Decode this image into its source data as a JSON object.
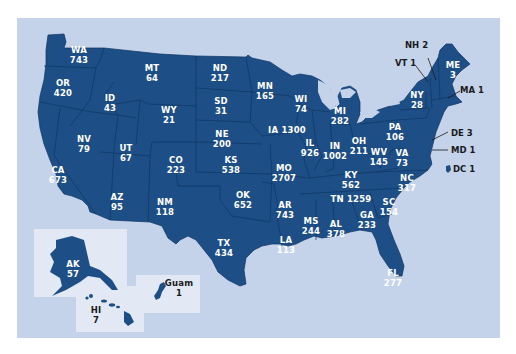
{
  "map": {
    "colors": {
      "background": "#ffffff",
      "panel": "#c4d2ea",
      "state_fill": "#1d4f86",
      "state_border": "#0f3563",
      "inset_box": "#e2e9f5",
      "label_text": "#ffffff",
      "external_label_text": "#1a1a1a"
    },
    "states": [
      {
        "abbr": "WA",
        "value": "743"
      },
      {
        "abbr": "OR",
        "value": "420"
      },
      {
        "abbr": "CA",
        "value": "673"
      },
      {
        "abbr": "ID",
        "value": "43"
      },
      {
        "abbr": "NV",
        "value": "79"
      },
      {
        "abbr": "MT",
        "value": "64"
      },
      {
        "abbr": "WY",
        "value": "21"
      },
      {
        "abbr": "UT",
        "value": "67"
      },
      {
        "abbr": "AZ",
        "value": "95"
      },
      {
        "abbr": "CO",
        "value": "223"
      },
      {
        "abbr": "NM",
        "value": "118"
      },
      {
        "abbr": "ND",
        "value": "217"
      },
      {
        "abbr": "SD",
        "value": "31"
      },
      {
        "abbr": "NE",
        "value": "200"
      },
      {
        "abbr": "KS",
        "value": "538"
      },
      {
        "abbr": "OK",
        "value": "652"
      },
      {
        "abbr": "TX",
        "value": "434"
      },
      {
        "abbr": "MN",
        "value": "165"
      },
      {
        "abbr": "IA",
        "value": "1300"
      },
      {
        "abbr": "MO",
        "value": "2707"
      },
      {
        "abbr": "AR",
        "value": "743"
      },
      {
        "abbr": "LA",
        "value": "113"
      },
      {
        "abbr": "WI",
        "value": "74"
      },
      {
        "abbr": "IL",
        "value": "926"
      },
      {
        "abbr": "MI",
        "value": "282"
      },
      {
        "abbr": "IN",
        "value": "1002"
      },
      {
        "abbr": "OH",
        "value": "211"
      },
      {
        "abbr": "KY",
        "value": "562"
      },
      {
        "abbr": "TN",
        "value": "1259"
      },
      {
        "abbr": "MS",
        "value": "244"
      },
      {
        "abbr": "AL",
        "value": "378"
      },
      {
        "abbr": "GA",
        "value": "233"
      },
      {
        "abbr": "FL",
        "value": "277"
      },
      {
        "abbr": "SC",
        "value": "154"
      },
      {
        "abbr": "NC",
        "value": "317"
      },
      {
        "abbr": "VA",
        "value": "73"
      },
      {
        "abbr": "WV",
        "value": "145"
      },
      {
        "abbr": "PA",
        "value": "106"
      },
      {
        "abbr": "NY",
        "value": "28"
      },
      {
        "abbr": "ME",
        "value": "3"
      },
      {
        "abbr": "NH",
        "value": "2"
      },
      {
        "abbr": "VT",
        "value": "1"
      },
      {
        "abbr": "MA",
        "value": "1"
      },
      {
        "abbr": "DE",
        "value": "3"
      },
      {
        "abbr": "MD",
        "value": "1"
      },
      {
        "abbr": "DC",
        "value": "1"
      }
    ],
    "insets": [
      {
        "abbr": "AK",
        "value": "57"
      },
      {
        "abbr": "HI",
        "value": "7"
      },
      {
        "abbr": "Guam",
        "value": "1"
      }
    ]
  }
}
